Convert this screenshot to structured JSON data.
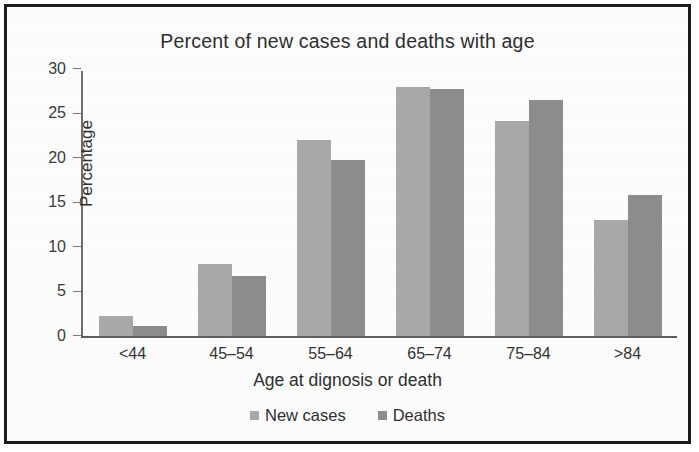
{
  "chart_data": {
    "type": "bar",
    "title": "Percent of new cases and deaths with age",
    "xlabel": "Age at dignosis or death",
    "ylabel": "Percentage",
    "categories": [
      "<44",
      "45–54",
      "55–64",
      "65–74",
      "75–84",
      ">84"
    ],
    "series": [
      {
        "name": "New cases",
        "color": "#a9a9a9",
        "values": [
          2.2,
          8.1,
          22.0,
          28.0,
          24.2,
          13.0
        ]
      },
      {
        "name": "Deaths",
        "color": "#8d8d8d",
        "values": [
          1.1,
          6.7,
          19.8,
          27.8,
          26.5,
          15.8
        ]
      }
    ],
    "ylim": [
      0,
      30
    ],
    "yticks": [
      0,
      5,
      10,
      15,
      20,
      25,
      30
    ],
    "ytick_labels": [
      "0",
      "5",
      "10",
      "15",
      "20",
      "25",
      "30"
    ],
    "grid": false,
    "legend_position": "bottom"
  },
  "figure": {
    "border_color": "#1c1c1c",
    "background": "#fdfdfd"
  }
}
